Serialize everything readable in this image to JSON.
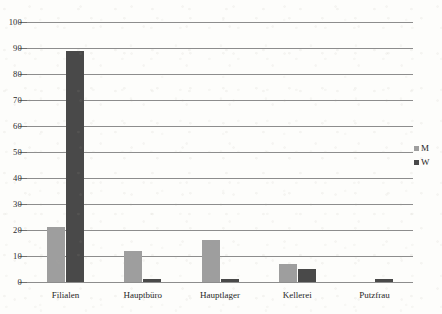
{
  "chart_data": {
    "type": "bar",
    "title": "",
    "xlabel": "",
    "ylabel": "",
    "categories": [
      "Filialen",
      "Hauptbüro",
      "Hauptlager",
      "Kellerei",
      "Putzfrau"
    ],
    "series": [
      {
        "name": "M",
        "color": "#9e9e9e",
        "values": [
          21,
          12,
          16,
          7,
          0
        ]
      },
      {
        "name": "W",
        "color": "#494949",
        "values": [
          89,
          1,
          1,
          5,
          1
        ]
      }
    ],
    "ylim": [
      0,
      100
    ],
    "yticks": [
      0,
      10,
      20,
      30,
      40,
      50,
      60,
      70,
      80,
      90,
      100
    ],
    "ytick_labels": [
      "0",
      "10",
      "20",
      "30",
      "40",
      "50",
      "60",
      "70",
      "80",
      "90",
      "100"
    ],
    "grid": true,
    "legend_position": "right",
    "legend_entries": [
      "M",
      "W"
    ]
  }
}
